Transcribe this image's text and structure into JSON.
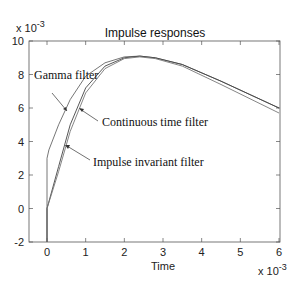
{
  "chart_data": {
    "type": "line",
    "title": "Impulse responses",
    "xlabel": "Time",
    "ylabel": "",
    "x_multiplier": "x 10^-3",
    "y_multiplier": "x 10^-3",
    "xlim": [
      -0.45,
      6
    ],
    "ylim": [
      -2,
      10
    ],
    "xticks": [
      0,
      1,
      2,
      3,
      4,
      5,
      6
    ],
    "yticks": [
      -2,
      0,
      2,
      4,
      6,
      8,
      10
    ],
    "grid": false,
    "legend": null,
    "series": [
      {
        "name": "Gamma filter",
        "x": [
          0,
          0,
          0.05,
          0.3,
          0.6,
          1.0,
          1.5,
          2.0,
          2.4,
          2.8,
          3.5,
          4.5,
          6.0
        ],
        "y": [
          -2,
          3.0,
          3.5,
          5.0,
          6.5,
          7.9,
          8.7,
          9.05,
          9.1,
          9.0,
          8.6,
          7.6,
          6.0
        ]
      },
      {
        "name": "Continuous time filter",
        "x": [
          0,
          0,
          0.3,
          0.6,
          1.0,
          1.5,
          2.0,
          2.4,
          2.8,
          3.5,
          4.5,
          6.0
        ],
        "y": [
          -2,
          0.0,
          2.5,
          5.0,
          7.2,
          8.5,
          9.0,
          9.1,
          9.0,
          8.6,
          7.6,
          6.0
        ]
      },
      {
        "name": "Impulse invariant filter",
        "x": [
          0,
          0,
          0.3,
          0.6,
          1.0,
          1.5,
          2.0,
          2.4,
          2.8,
          3.5,
          4.5,
          6.0
        ],
        "y": [
          -2,
          0.0,
          2.2,
          4.6,
          6.9,
          8.35,
          8.95,
          9.05,
          8.95,
          8.5,
          7.4,
          5.7
        ]
      }
    ],
    "annotations": [
      {
        "text": "Gamma filter",
        "arrow_to": [
          0.55,
          5.8
        ]
      },
      {
        "text": "Continuous time filter",
        "arrow_to": [
          0.72,
          5.7
        ]
      },
      {
        "text": "Impulse invariant filter",
        "arrow_to": [
          0.45,
          3.9
        ]
      }
    ]
  }
}
